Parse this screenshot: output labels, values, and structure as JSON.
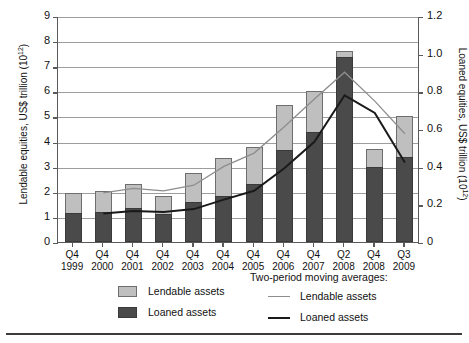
{
  "chart_data": {
    "type": "bar",
    "title": "",
    "xlabel": "",
    "ylabel": "Lendable equities, US$ trillion (10^12)",
    "ylabel_right": "Loaned equities, US$ trillion (10^12)",
    "ylim": [
      0,
      9
    ],
    "ylim_right": [
      0,
      1.2
    ],
    "yticks": [
      "9",
      "8",
      "7",
      "6",
      "5",
      "4",
      "3",
      "2",
      "1",
      "0"
    ],
    "yticks_right": [
      "1.2",
      "1.0",
      "0.8",
      "0.6",
      "0.4",
      "0.2",
      "0"
    ],
    "grid": true,
    "legend_position": "below",
    "categories": [
      {
        "quarter": "Q4",
        "year": "1999"
      },
      {
        "quarter": "Q4",
        "year": "2000"
      },
      {
        "quarter": "Q4",
        "year": "2001"
      },
      {
        "quarter": "Q4",
        "year": "2002"
      },
      {
        "quarter": "Q4",
        "year": "2003"
      },
      {
        "quarter": "Q4",
        "year": "2004"
      },
      {
        "quarter": "Q4",
        "year": "2005"
      },
      {
        "quarter": "Q4",
        "year": "2006"
      },
      {
        "quarter": "Q4",
        "year": "2007"
      },
      {
        "quarter": "Q2",
        "year": "2008"
      },
      {
        "quarter": "Q4",
        "year": "2008"
      },
      {
        "quarter": "Q3",
        "year": "2009"
      }
    ],
    "series": [
      {
        "name": "Lendable assets",
        "axis": "left",
        "kind": "bar-total",
        "color": "#bfbfbf",
        "values": [
          1.95,
          2.05,
          2.3,
          1.85,
          2.75,
          3.35,
          3.8,
          5.45,
          6.0,
          7.6,
          3.7,
          5.0
        ]
      },
      {
        "name": "Loaned assets",
        "axis": "right",
        "kind": "bar-sub",
        "color": "#4a4a4a",
        "values_left_scale": [
          1.15,
          1.2,
          1.35,
          1.1,
          1.6,
          1.85,
          2.3,
          3.65,
          4.4,
          7.35,
          3.0,
          3.4
        ],
        "values": [
          0.153,
          0.16,
          0.18,
          0.147,
          0.213,
          0.247,
          0.307,
          0.487,
          0.587,
          0.98,
          0.4,
          0.453
        ]
      },
      {
        "name": "Lendable assets (two-period moving average)",
        "axis": "left",
        "kind": "line",
        "color": "#8e8e8e",
        "values": [
          null,
          2.0,
          2.18,
          2.08,
          2.3,
          3.05,
          3.58,
          4.63,
          5.73,
          6.8,
          5.65,
          4.35
        ]
      },
      {
        "name": "Loaned assets (two-period moving average)",
        "axis": "right",
        "kind": "line",
        "color": "#1a1a1a",
        "values_left_scale": [
          null,
          1.18,
          1.28,
          1.23,
          1.35,
          1.73,
          2.08,
          2.98,
          4.03,
          5.88,
          5.18,
          3.2
        ],
        "values": [
          null,
          0.157,
          0.17,
          0.163,
          0.18,
          0.23,
          0.277,
          0.397,
          0.537,
          0.783,
          0.69,
          0.427
        ]
      }
    ]
  },
  "axes": {
    "left_title_main": "Lendable equities, US$ trillion (10",
    "left_title_sup": "12",
    "left_title_tail": ")",
    "right_title_main": "Loaned equities, US$ trillion (10",
    "right_title_sup": "12",
    "right_title_tail": ")"
  },
  "legend": {
    "bar_items": [
      {
        "label": "Lendable assets",
        "swatch": "lend"
      },
      {
        "label": "Loaned assets",
        "swatch": "loan"
      }
    ],
    "moving_avg_title": "Two-period moving averages:",
    "line_items": [
      {
        "label": "Lendable assets",
        "color": "#8e8e8e"
      },
      {
        "label": "Loaned assets",
        "color": "#1a1a1a"
      }
    ]
  }
}
